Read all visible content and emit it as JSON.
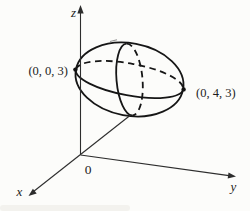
{
  "diagram": {
    "type": "3d-coordinate-sphere-figure",
    "axis_labels": {
      "x": "x",
      "y": "y",
      "z": "z"
    },
    "origin_label": "0",
    "points": [
      {
        "label": "(0, 0, 3)",
        "position": "left-tip"
      },
      {
        "label": "(0, 4, 3)",
        "position": "right-tip"
      }
    ],
    "colors": {
      "background": "#fcfcfa",
      "line": "#2d2d2d",
      "curve": "#161616",
      "sphere_light": "#ecebe7",
      "sphere_mid": "#d5d3cd",
      "sphere_dark": "#b6b4ad"
    }
  }
}
